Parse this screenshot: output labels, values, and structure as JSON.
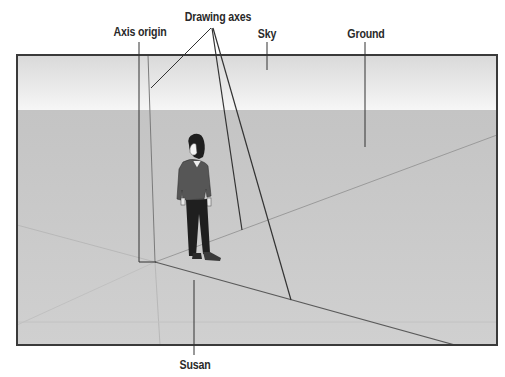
{
  "figure": {
    "callouts": {
      "drawing_axes": "Drawing axes",
      "axis_origin": "Axis origin",
      "sky": "Sky",
      "ground": "Ground",
      "susan": "Susan"
    },
    "colors": {
      "frame_border": "#3a3a3a",
      "sky_top": "#d8d8d8",
      "sky_horizon": "#f4f4f4",
      "ground": "#c9c9c9",
      "axis_solid": "#555555",
      "axis_dotted": "#b4b4b4",
      "callout_line": "#333333",
      "label_text": "#2a2a2a"
    }
  }
}
